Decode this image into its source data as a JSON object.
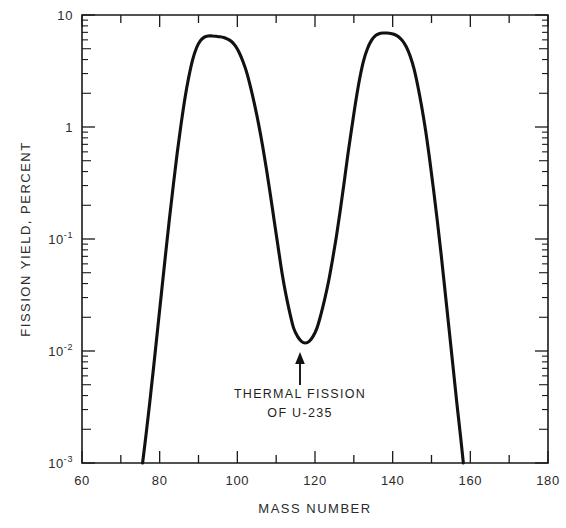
{
  "chart_data": {
    "type": "line",
    "title": "",
    "xlabel": "MASS NUMBER",
    "ylabel": "FISSION YIELD, PERCENT",
    "xlim": [
      60,
      180
    ],
    "ylim": [
      0.001,
      10
    ],
    "yscale": "log",
    "grid": false,
    "legend": null,
    "x_ticks_major": [
      60,
      80,
      100,
      120,
      140,
      160,
      180
    ],
    "x_tick_labels": [
      "60",
      "80",
      "100",
      "120",
      "140",
      "160",
      "180"
    ],
    "x_ticks_minor": [
      70,
      90,
      110,
      130,
      150,
      170
    ],
    "y_ticks_major": [
      10,
      1,
      0.1,
      0.01,
      0.001
    ],
    "y_tick_labels": [
      "10",
      "1",
      "10⁻¹",
      "10⁻²",
      "10⁻³"
    ],
    "y_tick_label_parts": [
      {
        "base": "10",
        "exp": ""
      },
      {
        "base": "1",
        "exp": ""
      },
      {
        "base": "10",
        "exp": "-1"
      },
      {
        "base": "10",
        "exp": "-2"
      },
      {
        "base": "10",
        "exp": "-3"
      }
    ],
    "annotations": [
      {
        "name": "thermal-fission-note",
        "line1": "THERMAL FISSION",
        "line2": "OF U-235",
        "points_to_x": 117,
        "points_to_y": 0.012
      }
    ],
    "series": [
      {
        "name": "Thermal fission of U-235 yield",
        "x": [
          75.6,
          76.5,
          77.5,
          78.5,
          79.5,
          80.5,
          81.5,
          82.5,
          83.5,
          84.5,
          85.5,
          86.5,
          87.5,
          88.5,
          89.5,
          90.5,
          91.5,
          92.5,
          93.5,
          94.5,
          95.5,
          96.5,
          97.5,
          98.5,
          99.5,
          100.5,
          101.5,
          102.5,
          103.5,
          104.5,
          105.5,
          106.5,
          107.5,
          108.5,
          109.5,
          110.5,
          111.5,
          112.5,
          113.5,
          114.5,
          115.5,
          116.5,
          117.5,
          118.5,
          119.5,
          120.5,
          121.5,
          122.5,
          123.5,
          124.5,
          125.5,
          126.5,
          127.5,
          128.5,
          129.5,
          130.5,
          131.5,
          132.5,
          133.5,
          134.5,
          135.5,
          136.5,
          137.5,
          138.5,
          139.5,
          140.5,
          141.5,
          142.5,
          143.5,
          144.5,
          145.5,
          146.5,
          147.5,
          148.5,
          149.5,
          150.5,
          151.5,
          152.5,
          153.5,
          154.5,
          155.5,
          156.5,
          157.5,
          158.2
        ],
        "y": [
          0.001,
          0.0018,
          0.0036,
          0.0075,
          0.016,
          0.034,
          0.072,
          0.15,
          0.3,
          0.58,
          1.05,
          1.8,
          2.8,
          4.0,
          5.1,
          5.9,
          6.35,
          6.5,
          6.5,
          6.45,
          6.4,
          6.3,
          6.1,
          5.8,
          5.3,
          4.6,
          3.8,
          3.0,
          2.2,
          1.55,
          1.05,
          0.68,
          0.42,
          0.25,
          0.145,
          0.085,
          0.05,
          0.032,
          0.022,
          0.016,
          0.0135,
          0.0122,
          0.0118,
          0.0122,
          0.0135,
          0.016,
          0.021,
          0.029,
          0.042,
          0.065,
          0.105,
          0.18,
          0.32,
          0.58,
          1.0,
          1.7,
          2.7,
          3.9,
          5.0,
          5.9,
          6.5,
          6.8,
          6.9,
          6.9,
          6.85,
          6.7,
          6.4,
          5.9,
          5.2,
          4.3,
          3.3,
          2.3,
          1.5,
          0.92,
          0.52,
          0.28,
          0.145,
          0.072,
          0.034,
          0.016,
          0.0075,
          0.0035,
          0.0017,
          0.001
        ]
      }
    ],
    "peaks": [
      {
        "name": "light-fragment-peak",
        "mass": 95,
        "yield_percent": 6.5
      },
      {
        "name": "heavy-fragment-peak",
        "mass": 139,
        "yield_percent": 6.9
      }
    ],
    "valley": {
      "name": "symmetric-fission-valley",
      "mass": 117,
      "yield_percent": 0.012
    }
  },
  "colors": {
    "curve": "#111111",
    "axis": "#1a1a1a",
    "text": "#2b2b2b",
    "background": "#ffffff"
  }
}
